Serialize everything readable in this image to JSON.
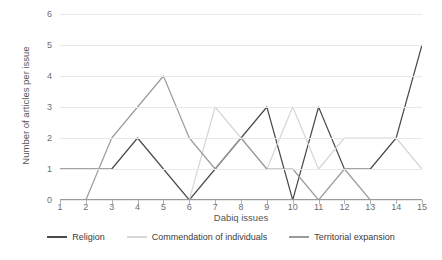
{
  "chart_data": {
    "type": "line",
    "title": "",
    "xlabel": "Dabiq issues",
    "ylabel": "Number of articles per issue",
    "categories": [
      1,
      2,
      3,
      4,
      5,
      6,
      7,
      8,
      9,
      10,
      11,
      12,
      13,
      14,
      15
    ],
    "x_tick_labels": [
      "1",
      "2",
      "3",
      "4",
      "5",
      "6",
      "7",
      "8",
      "9",
      "10",
      "11",
      "12",
      "13",
      "14",
      "15"
    ],
    "y_tick_labels": [
      "0",
      "1",
      "2",
      "3",
      "4",
      "5",
      "6"
    ],
    "y_ticks": [
      0,
      1,
      2,
      3,
      4,
      5,
      6
    ],
    "ylim": [
      0,
      6
    ],
    "xlim": [
      1,
      15
    ],
    "grid": "horizontal",
    "legend_position": "bottom",
    "series": [
      {
        "name": "Religion",
        "color": "#4a4a4a",
        "values": [
          1,
          1,
          1,
          2,
          1,
          0,
          1,
          2,
          3,
          0,
          3,
          1,
          1,
          2,
          5
        ]
      },
      {
        "name": "Commendation of individuals",
        "color": "#d6d6d6",
        "values": [
          0,
          0,
          0,
          0,
          0,
          0,
          3,
          2,
          1,
          3,
          1,
          2,
          2,
          2,
          1
        ]
      },
      {
        "name": "Territorial expansion",
        "color": "#9b9b9b",
        "values": [
          0,
          0,
          2,
          3,
          4,
          2,
          1,
          2,
          1,
          1,
          0,
          1,
          0,
          0,
          0
        ]
      }
    ]
  },
  "axes": {
    "x_title": "Dabiq issues",
    "y_title": "Number of articles per issue"
  },
  "legend": {
    "items": [
      {
        "label": "Religion",
        "color": "#4a4a4a"
      },
      {
        "label": "Commendation of individuals",
        "color": "#d6d6d6"
      },
      {
        "label": "Territorial expansion",
        "color": "#9b9b9b"
      }
    ]
  },
  "colors": {
    "gridline": "#e8e8e8",
    "axis": "#9a9a9a",
    "tick_text": "#6e6e6e",
    "title_text": "#555555",
    "background": "#ffffff"
  }
}
